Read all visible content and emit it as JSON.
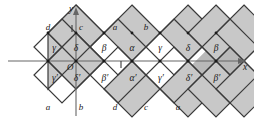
{
  "figure": {
    "type": "geometric-lattice-diagram",
    "background_color": "#ffffff",
    "cell_fill_color": "#c8c8c8",
    "cell_stroke_color": "#3a3a3a",
    "axis_color": "#555555",
    "shadow_color": "#b4b4b4",
    "axes": {
      "x_label": "x",
      "y_label": "y",
      "origin_label": "O"
    },
    "upper_cells": [
      {
        "label": "γ",
        "name": "gamma"
      },
      {
        "label": "δ",
        "name": "delta"
      },
      {
        "label": "β",
        "name": "beta"
      },
      {
        "label": "α",
        "name": "alpha"
      },
      {
        "label": "γ",
        "name": "gamma"
      },
      {
        "label": "δ",
        "name": "delta"
      },
      {
        "label": "β",
        "name": "beta"
      }
    ],
    "lower_cells": [
      {
        "label": "γ′",
        "name": "gamma-prime"
      },
      {
        "label": "δ′",
        "name": "delta-prime"
      },
      {
        "label": "β′",
        "name": "beta-prime"
      },
      {
        "label": "α′",
        "name": "alpha-prime"
      },
      {
        "label": "γ′",
        "name": "gamma-prime"
      },
      {
        "label": "δ′",
        "name": "delta-prime"
      },
      {
        "label": "β′",
        "name": "beta-prime"
      }
    ],
    "top_vertex_labels": [
      "d",
      "c",
      "a",
      "b"
    ],
    "bottom_vertex_labels": [
      "a",
      "b",
      "d",
      "c",
      "a"
    ]
  }
}
